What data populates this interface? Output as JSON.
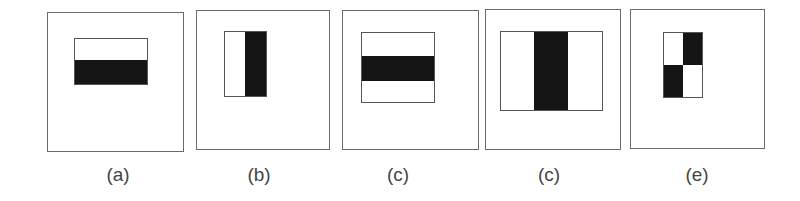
{
  "figure": {
    "panels": [
      {
        "label": "(a)",
        "feature": "two-rectangle horizontal edge (white top, black bottom)"
      },
      {
        "label": "(b)",
        "feature": "two-rectangle vertical edge (white left, black right)"
      },
      {
        "label": "(c)",
        "feature": "three-rectangle horizontal line (black middle band)"
      },
      {
        "label": "(c)",
        "feature": "three-rectangle vertical line (black middle band)"
      },
      {
        "label": "(e)",
        "feature": "four-rectangle diagonal (checkerboard)"
      }
    ],
    "colors": {
      "dark": "#151515",
      "light": "#ffffff",
      "border": "#6a6a6a"
    }
  }
}
